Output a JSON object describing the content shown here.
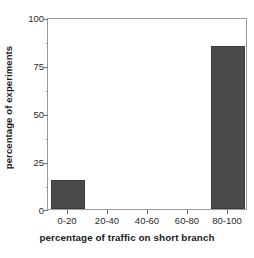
{
  "chart_data": {
    "type": "bar",
    "title": "",
    "subtitle": "",
    "xlabel": "percentage of traffic on short branch",
    "ylabel": "percentage of experiments",
    "categories": [
      "0-20",
      "20-40",
      "40-60",
      "60-80",
      "80-100"
    ],
    "values": [
      15,
      0,
      0,
      0,
      85
    ],
    "series": [
      {
        "name": "percentage of experiments",
        "values": [
          15,
          0,
          0,
          0,
          85
        ]
      }
    ],
    "ylim": [
      0,
      100
    ],
    "yticks": [
      0,
      25,
      50,
      75,
      100
    ],
    "ytick_labels": [
      "0",
      "25",
      "50",
      "75",
      "100"
    ],
    "y_minor_ticks": [
      12.5,
      37.5,
      62.5,
      87.5
    ],
    "grid": false,
    "legend": null,
    "legend_position": "none",
    "annotations": [],
    "bar_color": "#4a4a4a",
    "frame_color": "#9a9aa2",
    "background_color": "#ffffff",
    "text_color": "#1a1a1a"
  }
}
